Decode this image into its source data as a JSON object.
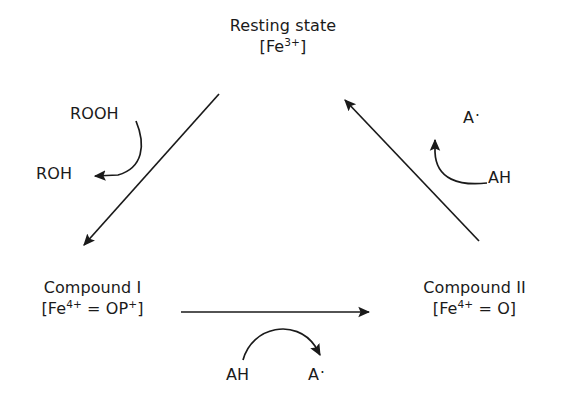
{
  "diagram": {
    "type": "cycle",
    "stroke_color": "#1a1a1a",
    "background_color": "#ffffff",
    "nodes": [
      {
        "id": "resting",
        "title": "Resting state",
        "formula_prefix": "[Fe",
        "formula_sup": "3+",
        "formula_suffix": "]"
      },
      {
        "id": "compound_i",
        "title": "Compound I",
        "formula_prefix": "[Fe",
        "formula_sup": "4+",
        "formula_suffix": " = OP",
        "formula_sup2": "+",
        "formula_end": "]"
      },
      {
        "id": "compound_ii",
        "title": "Compound II",
        "formula_prefix": "[Fe",
        "formula_sup": "4+",
        "formula_suffix": " = O]"
      }
    ],
    "species": {
      "rooh": "ROOH",
      "roh": "ROH",
      "ah_right": "AH",
      "a_radical_right": "A",
      "ah_bottom": "AH",
      "a_radical_bottom": "A",
      "radical_dot": "·"
    },
    "edges": [
      {
        "id": "resting-to-compound-i",
        "from": "resting",
        "to": "compound_i",
        "style": "straight-diagonal"
      },
      {
        "id": "compound-i-to-compound-ii",
        "from": "compound_i",
        "to": "compound_ii",
        "style": "straight-horizontal"
      },
      {
        "id": "compound-ii-to-resting",
        "from": "compound_ii",
        "to": "resting",
        "style": "straight-diagonal"
      },
      {
        "id": "rooh-to-roh",
        "from": "rooh",
        "to": "roh",
        "style": "curved"
      },
      {
        "id": "ah-to-a-right",
        "from": "ah_right",
        "to": "a_radical_right",
        "style": "curved"
      },
      {
        "id": "ah-to-a-bottom",
        "from": "ah_bottom",
        "to": "a_radical_bottom",
        "style": "curved"
      }
    ]
  }
}
